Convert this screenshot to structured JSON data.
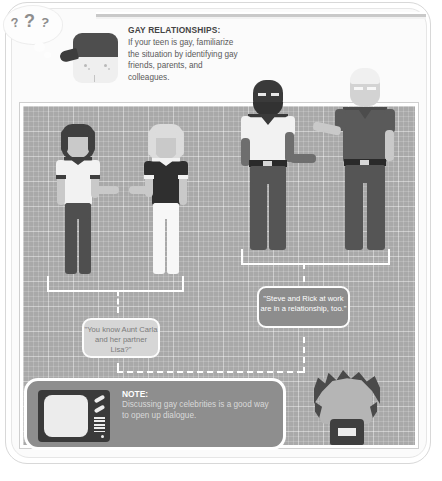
{
  "header": {
    "title": "GAY RELATIONSHIPS:",
    "body": "If your teen is gay, familiarize the situation by identifying gay friends, parents, and colleagues.",
    "thought_marks": [
      "?",
      "?",
      "?"
    ]
  },
  "bubbles": {
    "women": "\"You know Aunt Carla and her partner Lisa?\"",
    "men": "\"Steve and Rick at work are in a relationship, too.\""
  },
  "note": {
    "title": "NOTE:",
    "body": "Discussing gay celebrities is a good way to open up dialogue."
  },
  "figures": [
    {
      "name": "woman-dark-hair",
      "hair": "dark",
      "top": "white",
      "pants": "dark"
    },
    {
      "name": "woman-light-hair",
      "hair": "light",
      "top": "dark",
      "pants": "white"
    },
    {
      "name": "man-bearded",
      "hair": "dark",
      "top": "white",
      "pants": "dark"
    },
    {
      "name": "man-light-hair",
      "hair": "light",
      "top": "dark",
      "pants": "dark"
    },
    {
      "name": "teen",
      "hair": "dark-spiky",
      "top": "dark"
    }
  ],
  "colors": {
    "grid_background": "#a9a9a9",
    "panel_border": "#ffffff",
    "note_background": "#8e8e8e",
    "bubble_light": "#d6d6d6",
    "bubble_dark": "#8d8d8d",
    "text_dark": "#444444",
    "text_body": "#5a5a5a",
    "skin_light": "#c9c9c9",
    "skin_dark": "#6e6e6e",
    "garment_dark": "#3f3f3f",
    "garment_white": "#f2f2f2"
  }
}
